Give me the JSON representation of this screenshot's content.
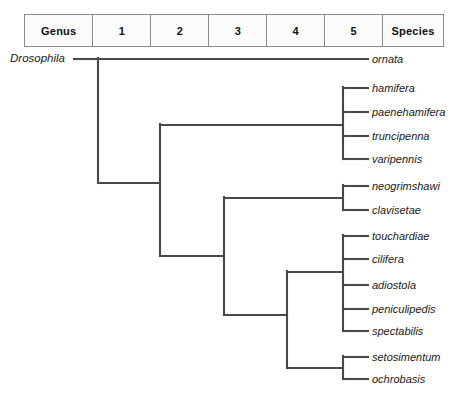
{
  "figure": {
    "type": "cladogram"
  },
  "header": {
    "cells": [
      {
        "label": "Genus",
        "kind": "rank-name"
      },
      {
        "label": "1",
        "kind": "rank-number"
      },
      {
        "label": "2",
        "kind": "rank-number"
      },
      {
        "label": "3",
        "kind": "rank-number"
      },
      {
        "label": "4",
        "kind": "rank-number"
      },
      {
        "label": "5",
        "kind": "rank-number"
      },
      {
        "label": "Species",
        "kind": "rank-name"
      }
    ]
  },
  "tree": {
    "genus_label": "Drosophila",
    "line_color": "#494949",
    "tips": [
      {
        "name": "ornata",
        "y": 59
      },
      {
        "name": "hamifera",
        "y": 88
      },
      {
        "name": "paenehamifera",
        "y": 112
      },
      {
        "name": "truncipenna",
        "y": 136
      },
      {
        "name": "varipennis",
        "y": 159
      },
      {
        "name": "neogrimshawi",
        "y": 186
      },
      {
        "name": "clavisetae",
        "y": 210
      },
      {
        "name": "touchardiae",
        "y": 236
      },
      {
        "name": "cilifera",
        "y": 259
      },
      {
        "name": "adiostola",
        "y": 285
      },
      {
        "name": "peniculipedis",
        "y": 309
      },
      {
        "name": "spectabilis",
        "y": 331
      },
      {
        "name": "setosimentum",
        "y": 357
      },
      {
        "name": "ochrobasis",
        "y": 379
      }
    ],
    "nodes": {
      "root_x": 98,
      "node_level2_x": 160,
      "node_level3_x": 224,
      "node_level4_x": 287,
      "tip_bar_x": 343,
      "tip_end_x": 368,
      "root_stem_x": 74
    }
  }
}
